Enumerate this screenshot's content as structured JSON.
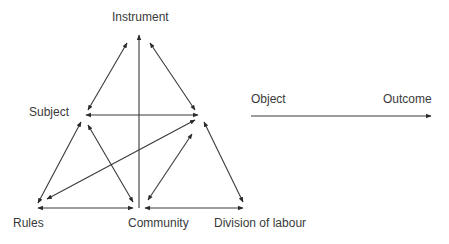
{
  "diagram": {
    "nodes": {
      "instrument": "Instrument",
      "subject": "Subject",
      "rules": "Rules",
      "community": "Community",
      "division": "Division of labour",
      "object": "Object",
      "outcome": "Outcome"
    },
    "colors": {
      "line": "#2a2a2a",
      "text": "#3a3a3a"
    }
  }
}
